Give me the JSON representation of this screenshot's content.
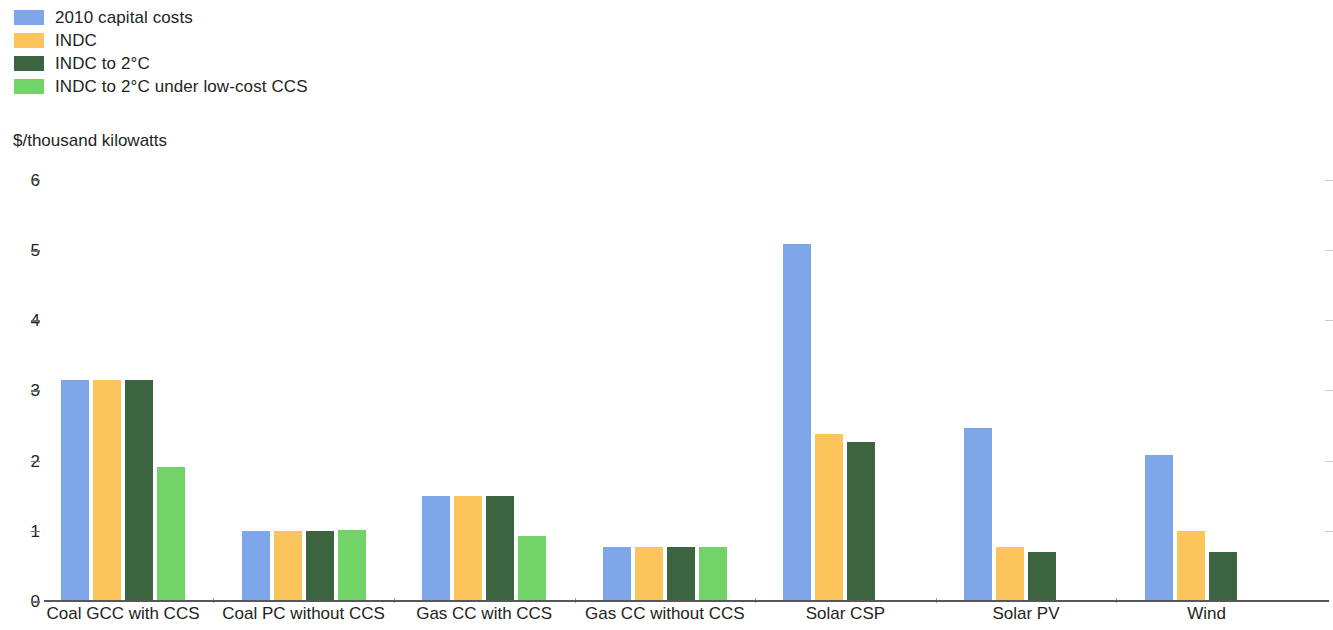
{
  "legend": {
    "items": [
      {
        "label": "2010 capital costs",
        "color": "#7ea6e8"
      },
      {
        "label": "INDC",
        "color": "#fbc55c"
      },
      {
        "label": "INDC to 2°C",
        "color": "#3d6440"
      },
      {
        "label": "INDC to 2°C under low-cost CCS",
        "color": "#72d468"
      }
    ]
  },
  "axis": {
    "unit_caption": "$/thousand kilowatts",
    "y_ticks": [
      "0",
      "1",
      "2",
      "3",
      "4",
      "5",
      "6"
    ]
  },
  "chart_data": {
    "type": "bar",
    "title": "",
    "subtitle": "",
    "xlabel": "",
    "ylabel": "$/thousand kilowatts",
    "ylim": [
      0,
      6
    ],
    "ytick_values": [
      0,
      1,
      2,
      3,
      4,
      5,
      6
    ],
    "grid": false,
    "legend_position": "top-left",
    "categories": [
      "Coal GCC with CCS",
      "Coal PC without CCS",
      "Gas CC with CCS",
      "Gas CC without CCS",
      "Solar CSP",
      "Solar PV",
      "Wind"
    ],
    "series": [
      {
        "name": "2010 capital costs",
        "color": "#7ea6e8",
        "values": [
          3.15,
          1.0,
          1.49,
          0.77,
          5.09,
          2.47,
          2.08
        ]
      },
      {
        "name": "INDC",
        "color": "#fbc55c",
        "values": [
          3.15,
          1.0,
          1.49,
          0.77,
          2.38,
          0.77,
          1.0
        ]
      },
      {
        "name": "INDC to 2°C",
        "color": "#3d6440",
        "values": [
          3.15,
          1.0,
          1.49,
          0.77,
          2.27,
          0.7,
          0.7
        ]
      },
      {
        "name": "INDC to 2°C under low-cost CCS",
        "color": "#72d468",
        "values": [
          1.91,
          1.01,
          0.93,
          0.77,
          null,
          null,
          null
        ]
      }
    ]
  }
}
